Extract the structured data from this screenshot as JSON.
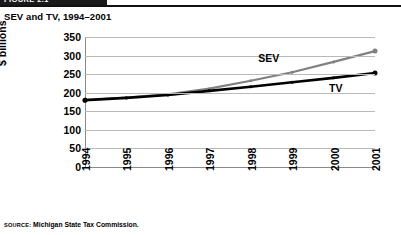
{
  "banner": {
    "label": "FIGURE 2.1"
  },
  "title": "SEV and TV, 1994–2001",
  "source": {
    "prefix": "SOURCE:",
    "text": "Michigan State Tax Commission."
  },
  "colors": {
    "sev_line": "#808080",
    "tv_line": "#000000",
    "gridline": "#b9b9b9",
    "axis": "#8a8a8a",
    "banner_bg": "#1a1a1a",
    "background": "#ffffff"
  },
  "chart_data": {
    "type": "line",
    "title": "SEV and TV, 1994–2001",
    "xlabel": "",
    "ylabel": "$ billions",
    "categories": [
      "1994",
      "1995",
      "1996",
      "1997",
      "1998",
      "1999",
      "2000",
      "2001"
    ],
    "xtick_labels": [
      "1994",
      "1995",
      "1996",
      "1997",
      "1998",
      "1999",
      "2000",
      "2001"
    ],
    "xtick_rotation": 90,
    "ylim": [
      0,
      350
    ],
    "ytick_labels": [
      "350",
      "300",
      "250",
      "200",
      "150",
      "100",
      "50",
      "0"
    ],
    "ytick_values": [
      350,
      300,
      250,
      200,
      150,
      100,
      50,
      0
    ],
    "ystep": 50,
    "grid": "horizontal",
    "legend": "inline-annotations",
    "series": [
      {
        "name": "SEV",
        "color": "#808080",
        "label_position": "above-line",
        "values": [
          180,
          187,
          196,
          211,
          232,
          255,
          283,
          312
        ]
      },
      {
        "name": "TV",
        "color": "#000000",
        "label_position": "below-line",
        "values": [
          180,
          186,
          194,
          205,
          216,
          228,
          240,
          253
        ]
      }
    ],
    "annotations": [
      {
        "text": "SEV",
        "series": "SEV"
      },
      {
        "text": "TV",
        "series": "TV"
      }
    ]
  }
}
